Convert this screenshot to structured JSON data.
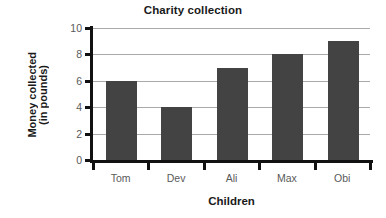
{
  "chart_data": {
    "type": "bar",
    "title": "Charity collection",
    "xlabel": "Children",
    "ylabel_line1": "Money collected",
    "ylabel_line2": "(in pounds)",
    "ylabel": "Money collected (in pounds)",
    "categories": [
      "Tom",
      "Dev",
      "Ali",
      "Max",
      "Obi"
    ],
    "values": [
      6,
      4,
      7,
      8,
      9
    ],
    "ylim": [
      0,
      10
    ],
    "ytick_labels": [
      "0",
      "2",
      "4",
      "6",
      "8",
      "10"
    ],
    "ytick_values": [
      0,
      2,
      4,
      6,
      8,
      10
    ],
    "grid": true,
    "legend": "none",
    "colors": {
      "bar": "#434343",
      "gridline": "#a9a9a9",
      "axis": "#111111",
      "tick_label": "#5a5a5a",
      "title": "#1a1a1a",
      "background": "#ffffff"
    }
  }
}
